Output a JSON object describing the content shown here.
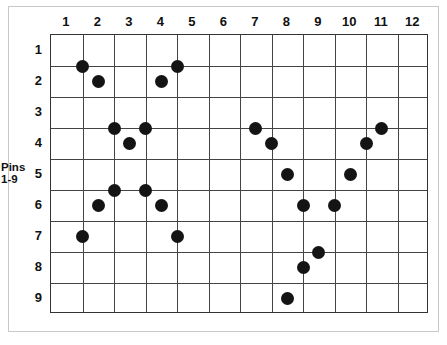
{
  "figure": {
    "axis_label": {
      "line1": "Pins",
      "line2": "1-9"
    }
  },
  "chart_data": {
    "type": "scatter",
    "title": "",
    "xlabel": "",
    "ylabel": "Pins 1-9",
    "grid": true,
    "legend": "none",
    "xlim": [
      0.5,
      12.5
    ],
    "ylim": [
      0.5,
      9.5
    ],
    "x_tick_labels": [
      "1",
      "2",
      "3",
      "4",
      "5",
      "6",
      "7",
      "8",
      "9",
      "10",
      "11",
      "12"
    ],
    "y_tick_labels": [
      "1",
      "2",
      "3",
      "4",
      "5",
      "6",
      "7",
      "8",
      "9"
    ],
    "x_ticks": [
      1,
      2,
      3,
      4,
      5,
      6,
      7,
      8,
      9,
      10,
      11,
      12
    ],
    "y_ticks": [
      1,
      2,
      3,
      4,
      5,
      6,
      7,
      8,
      9
    ],
    "marker": "filled-circle",
    "marker_color": "#141414",
    "marker_size": 13,
    "points": [
      {
        "x": 1.5,
        "y": 1.5
      },
      {
        "x": 4.5,
        "y": 1.5
      },
      {
        "x": 2.0,
        "y": 2.0
      },
      {
        "x": 4.0,
        "y": 2.0
      },
      {
        "x": 2.5,
        "y": 3.5
      },
      {
        "x": 3.5,
        "y": 3.5
      },
      {
        "x": 7.0,
        "y": 3.5
      },
      {
        "x": 11.0,
        "y": 3.5
      },
      {
        "x": 3.0,
        "y": 4.0
      },
      {
        "x": 7.5,
        "y": 4.0
      },
      {
        "x": 10.5,
        "y": 4.0
      },
      {
        "x": 2.5,
        "y": 5.5
      },
      {
        "x": 3.5,
        "y": 5.5
      },
      {
        "x": 8.0,
        "y": 5.0
      },
      {
        "x": 10.0,
        "y": 5.0
      },
      {
        "x": 2.0,
        "y": 6.0
      },
      {
        "x": 4.0,
        "y": 6.0
      },
      {
        "x": 8.5,
        "y": 6.0
      },
      {
        "x": 9.5,
        "y": 6.0
      },
      {
        "x": 1.5,
        "y": 7.0
      },
      {
        "x": 4.5,
        "y": 7.0
      },
      {
        "x": 9.0,
        "y": 7.5
      },
      {
        "x": 8.5,
        "y": 8.0
      },
      {
        "x": 8.0,
        "y": 9.0
      }
    ]
  },
  "colors": {
    "grid_line": "#444444",
    "plot_border": "#333333",
    "outer_frame": "#c8c8c8",
    "marker": "#141414",
    "text": "#111111",
    "background": "#ffffff"
  }
}
